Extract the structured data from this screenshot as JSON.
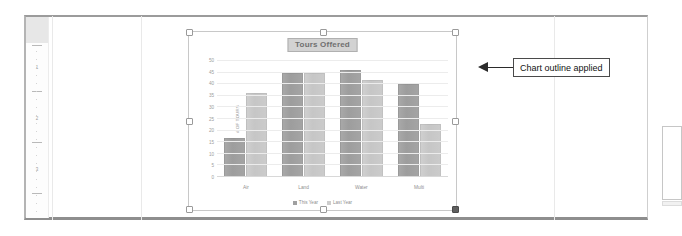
{
  "document": {
    "vertical_ruler": {
      "name": "vertical-ruler",
      "marks": [
        "1",
        "2",
        "3"
      ]
    }
  },
  "annotation": {
    "callout_text": "Chart outline applied",
    "arrow_direction": "left"
  },
  "chart_data": {
    "type": "bar",
    "title": "Tours Offered",
    "categories": [
      "Air",
      "Land",
      "Water",
      "Multi"
    ],
    "series": [
      {
        "name": "This Year",
        "values": [
          17,
          45,
          46,
          40
        ],
        "color": "#a0a0a0"
      },
      {
        "name": "Last Year",
        "values": [
          36,
          45,
          42,
          23
        ],
        "color": "#cdcdcd"
      }
    ],
    "xlabel": "",
    "ylabel": "# OF TOURS",
    "ylim": [
      0,
      50
    ],
    "yticks": [
      0,
      5,
      10,
      15,
      20,
      25,
      30,
      35,
      40,
      45,
      50
    ],
    "grid": true,
    "legend_position": "bottom",
    "selected": true
  }
}
